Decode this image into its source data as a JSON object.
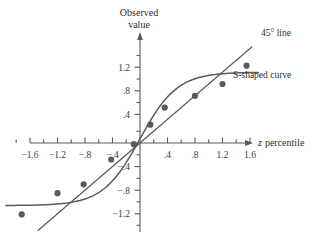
{
  "chart_data": {
    "type": "scatter",
    "title": "",
    "xlabel": "z percentile",
    "ylabel": "Observed value",
    "xlim": [
      -1.9,
      1.85
    ],
    "ylim": [
      -1.45,
      1.6
    ],
    "grid": false,
    "legend_position": "inline-annotations",
    "x_ticks_major": [
      -1.6,
      -1.2,
      -0.8,
      -0.4,
      0.4,
      0.8,
      1.2,
      1.6
    ],
    "x_tick_labels": [
      "−1.6",
      "−1.2",
      "−.8",
      "−.4",
      ".4",
      ".8",
      "1.2",
      "1.6"
    ],
    "x_ticks_minor": [
      -1.8,
      -1.4,
      -1.0,
      -0.6,
      -0.2,
      0.2,
      0.6,
      1.0,
      1.4,
      1.8
    ],
    "y_ticks_major": [
      -1.2,
      -0.8,
      -0.4,
      0.4,
      0.8,
      1.2
    ],
    "y_tick_labels": [
      "−1.2",
      "−.8",
      "−.4",
      ".4",
      ".8",
      "1.2"
    ],
    "y_ticks_minor": [
      -1.4,
      -1.0,
      -0.6,
      -0.2,
      0.2,
      0.6,
      1.0,
      1.4
    ],
    "points": [
      {
        "x": -1.72,
        "y": -1.21
      },
      {
        "x": -1.2,
        "y": -0.85
      },
      {
        "x": -0.82,
        "y": -0.7
      },
      {
        "x": -0.42,
        "y": -0.28
      },
      {
        "x": -0.09,
        "y": -0.02
      },
      {
        "x": 0.15,
        "y": 0.31
      },
      {
        "x": 0.36,
        "y": 0.6
      },
      {
        "x": 0.8,
        "y": 0.8
      },
      {
        "x": 1.2,
        "y": 1.0
      },
      {
        "x": 1.55,
        "y": 1.31
      }
    ],
    "series": [
      {
        "name": "45° line",
        "type": "line",
        "x_start": -1.48,
        "x_end": 1.63,
        "slope": 1.0,
        "intercept": 0.0
      },
      {
        "name": "S-shaped curve",
        "type": "curve",
        "x_start": -1.95,
        "x_end": 1.72,
        "asymptote_low": -1.06,
        "asymptote_high": 1.2
      }
    ],
    "annotations": [
      {
        "name": "line-annotation",
        "text": "45° line",
        "x": 1.69,
        "y": 1.52
      },
      {
        "name": "curve-annotation",
        "text": "S-shaped curve",
        "x": 1.28,
        "y": 0.9
      }
    ],
    "axis_titles": {
      "y_line1": "Observed",
      "y_line2": "value",
      "x_italic": "z",
      "x_rest": "percentile"
    }
  }
}
